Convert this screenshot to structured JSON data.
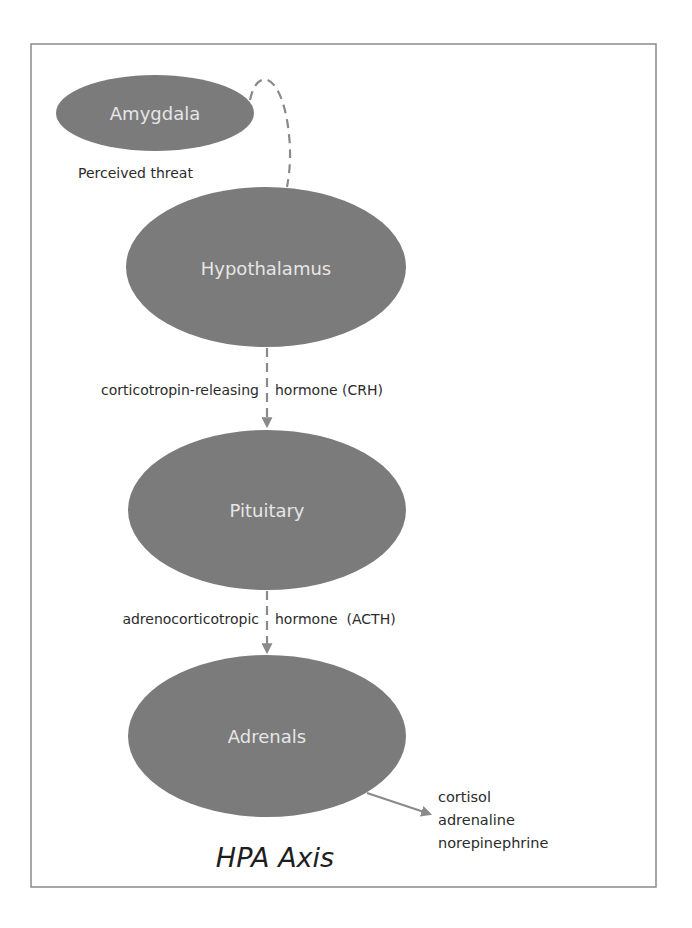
{
  "diagram": {
    "title": "HPA Axis",
    "nodes": [
      {
        "id": "amygdala",
        "label": "Amygdala"
      },
      {
        "id": "hypothalamus",
        "label": "Hypothalamus"
      },
      {
        "id": "pituitary",
        "label": "Pituitary"
      },
      {
        "id": "adrenals",
        "label": "Adrenals"
      }
    ],
    "edges": [
      {
        "from": "amygdala",
        "to": "hypothalamus",
        "label": "Perceived threat",
        "style": "dashed"
      },
      {
        "from": "hypothalamus",
        "to": "pituitary",
        "label_left": "corticotropin-releasing",
        "label_right": "hormone (CRH)",
        "style": "dashed-arrow"
      },
      {
        "from": "pituitary",
        "to": "adrenals",
        "label_left": "adrenocorticotropic",
        "label_right": "hormone  (ACTH)",
        "style": "dashed-arrow"
      },
      {
        "from": "adrenals",
        "to": "outputs",
        "style": "solid-arrow"
      }
    ],
    "outputs": [
      "cortisol",
      "adrenaline",
      "norepinephrine"
    ],
    "colors": {
      "node_fill": "#7b7b7b",
      "node_text": "#e6e6e6",
      "connector": "#8a8a8a",
      "label_text": "#2b2b2b",
      "frame_border": "#8a8a8a"
    }
  }
}
